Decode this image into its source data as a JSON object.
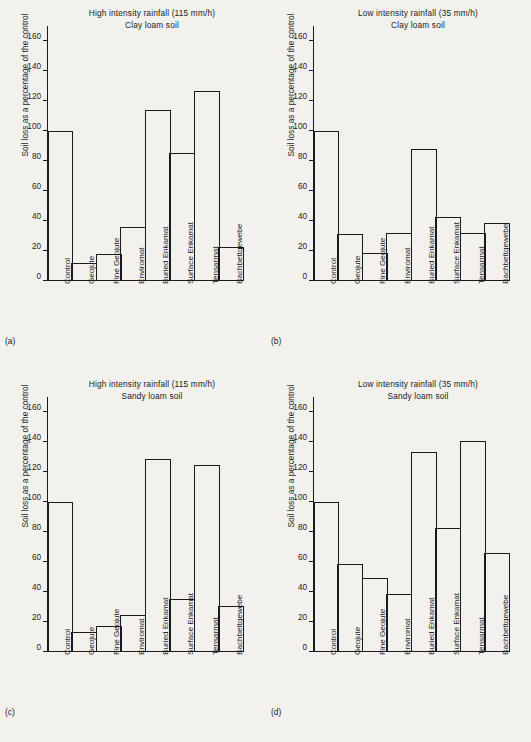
{
  "figure": {
    "y_axis_label": "Soil loss as a percentage of the control",
    "categories": [
      "Control",
      "Geojute",
      "Fine Geojute",
      "Enviromat",
      "Buried Enkamat",
      "Surface Enkamat",
      "Tensarmat",
      "Bachbettgewebe"
    ],
    "y_ticks": [
      0,
      20,
      40,
      60,
      80,
      100,
      120,
      140,
      160
    ],
    "ylim": [
      0,
      170
    ],
    "line_color": "#1a1a1a",
    "background_color": "#f2f1ee"
  },
  "panels": [
    {
      "key": "a",
      "label": "(a)",
      "title_line1": "High intensity rainfall (115 mm/h)",
      "title_line2": "Clay loam soil"
    },
    {
      "key": "b",
      "label": "(b)",
      "title_line1": "Low intensity rainfall (35 mm/h)",
      "title_line2": "Clay loam soil"
    },
    {
      "key": "c",
      "label": "(c)",
      "title_line1": "High intensity rainfall (115 mm/h)",
      "title_line2": "Sandy loam soil"
    },
    {
      "key": "d",
      "label": "(d)",
      "title_line1": "Low intensity rainfall (35 mm/h)",
      "title_line2": "Sandy loam soil"
    }
  ],
  "chart_data": [
    {
      "type": "bar",
      "panel": "(a)",
      "title": "High intensity rainfall (115 mm/h) — Clay loam soil",
      "xlabel": "",
      "ylabel": "Soil loss as a percentage of the control",
      "ylim": [
        0,
        170
      ],
      "yticks": [
        0,
        20,
        40,
        60,
        80,
        100,
        120,
        140,
        160
      ],
      "grid": false,
      "categories": [
        "Control",
        "Geojute",
        "Fine Geojute",
        "Enviromat",
        "Buried Enkamat",
        "Surface Enkamat",
        "Tensarmat",
        "Bachbettgewebe"
      ],
      "values": [
        100,
        12,
        18,
        36,
        114,
        85.5,
        126.5,
        22.5
      ]
    },
    {
      "type": "bar",
      "panel": "(b)",
      "title": "Low intensity rainfall (35 mm/h) — Clay loam soil",
      "xlabel": "",
      "ylabel": "Soil loss as a percentage of the control",
      "ylim": [
        0,
        170
      ],
      "yticks": [
        0,
        20,
        40,
        60,
        80,
        100,
        120,
        140,
        160
      ],
      "grid": false,
      "categories": [
        "Control",
        "Geojute",
        "Fine Geojute",
        "Enviromat",
        "Buried Enkamat",
        "Surface Enkamat",
        "Tensarmat",
        "Bachbettgewebe"
      ],
      "values": [
        100,
        31.5,
        18.5,
        32,
        88,
        43,
        32,
        39
      ]
    },
    {
      "type": "bar",
      "panel": "(c)",
      "title": "High intensity rainfall (115 mm/h) — Sandy loam soil",
      "xlabel": "",
      "ylabel": "Soil loss as a percentage of the control",
      "ylim": [
        0,
        170
      ],
      "yticks": [
        0,
        20,
        40,
        60,
        80,
        100,
        120,
        140,
        160
      ],
      "grid": false,
      "categories": [
        "Control",
        "Geojute",
        "Fine Geojute",
        "Enviromat",
        "Buried Enkamat",
        "Surface Enkamat",
        "Tensarmat",
        "Bachbettgewebe"
      ],
      "values": [
        100,
        13.5,
        17.5,
        24.5,
        128.5,
        35.5,
        124.5,
        31
      ]
    },
    {
      "type": "bar",
      "panel": "(d)",
      "title": "Low intensity rainfall (35 mm/h) — Sandy loam soil",
      "xlabel": "",
      "ylabel": "Soil loss as a percentage of the control",
      "ylim": [
        0,
        170
      ],
      "yticks": [
        0,
        20,
        40,
        60,
        80,
        100,
        120,
        140,
        160
      ],
      "grid": false,
      "categories": [
        "Control",
        "Geojute",
        "Fine Geojute",
        "Enviromat",
        "Buried Enkamat",
        "Surface Enkamat",
        "Tensarmat",
        "Bachbettgewebe"
      ],
      "values": [
        100,
        59,
        49.5,
        39,
        133.5,
        82.5,
        141,
        66
      ]
    }
  ]
}
